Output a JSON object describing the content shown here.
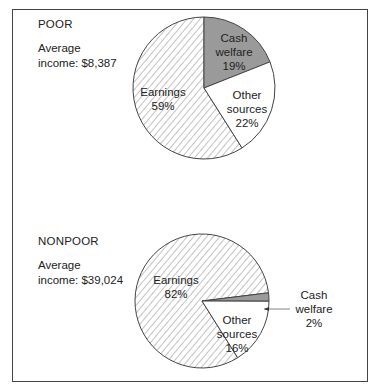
{
  "chart_data": [
    {
      "type": "pie",
      "title": "POOR",
      "subtitle": "Average income: $8,387",
      "categories": [
        "Cash welfare",
        "Other sources",
        "Earnings"
      ],
      "values": [
        19,
        22,
        59
      ],
      "unit": "%",
      "fills": [
        "#9a9a9a",
        "#ffffff",
        "hatched"
      ]
    },
    {
      "type": "pie",
      "title": "NONPOOR",
      "subtitle": "Average income: $39,024",
      "categories": [
        "Cash welfare",
        "Other sources",
        "Earnings"
      ],
      "values": [
        2,
        16,
        82
      ],
      "unit": "%",
      "fills": [
        "#9a9a9a",
        "#ffffff",
        "hatched"
      ]
    }
  ],
  "poor": {
    "title": "POOR",
    "avg_line1": "Average",
    "avg_line2": "income: $8,387",
    "cash": [
      "Cash",
      "welfare",
      "19%"
    ],
    "other": [
      "Other",
      "sources",
      "22%"
    ],
    "earnings": [
      "Earnings",
      "59%"
    ]
  },
  "nonpoor": {
    "title": "NONPOOR",
    "avg_line1": "Average",
    "avg_line2": "income: $39,024",
    "cash": [
      "Cash",
      "welfare",
      "2%"
    ],
    "other": [
      "Other",
      "sources",
      "16%"
    ],
    "earnings": [
      "Earnings",
      "82%"
    ]
  }
}
